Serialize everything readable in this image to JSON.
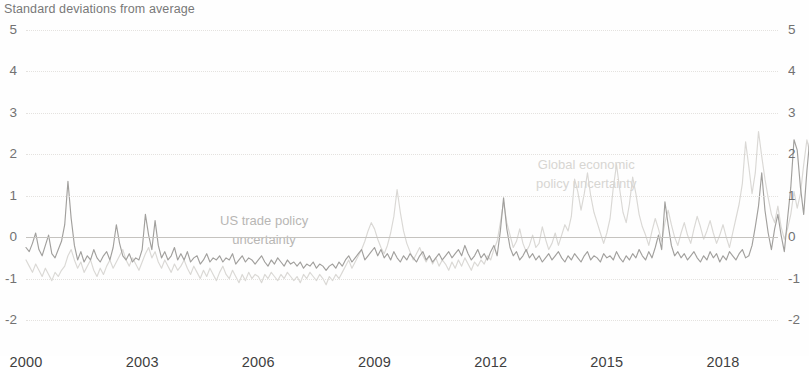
{
  "chart": {
    "axis_title": "Standard deviations from average",
    "y_ticks": [
      "5",
      "4",
      "3",
      "2",
      "1",
      "0",
      "-1",
      "-2"
    ],
    "x_ticks": [
      "2000",
      "2003",
      "2006",
      "2009",
      "2012",
      "2015",
      "2018"
    ],
    "annotations": {
      "us": "US trade policy\nuncertainty",
      "us_line1": "US trade policy",
      "us_line2": "uncertainty",
      "global_line1": "Global economic",
      "global_line2": "policy uncertainty"
    },
    "colors": {
      "us_trade_policy": "#8d8b88",
      "global_epu": "#d2d0cc",
      "zero_line": "#b9b6b1",
      "gridline": "#d9d7d2",
      "text": "#4a4a4a"
    }
  },
  "chart_data": {
    "type": "line",
    "title": "",
    "subtitle": "",
    "xlabel": "",
    "ylabel": "Standard deviations from average",
    "ylim": [
      -2,
      5
    ],
    "xlim": [
      2000.0,
      2019.42
    ],
    "grid": true,
    "legend": "annotations-inline",
    "y_tick_values": [
      5,
      4,
      3,
      2,
      1,
      0,
      -1,
      -2
    ],
    "x_tick_values": [
      2000,
      2003,
      2006,
      2009,
      2012,
      2015,
      2018
    ],
    "series": [
      {
        "name": "US trade policy uncertainty",
        "color": "#8d8b88",
        "x_start": 2000.0,
        "x_step": 0.0833333,
        "values": [
          -0.25,
          -0.35,
          -0.15,
          0.1,
          -0.3,
          -0.45,
          -0.2,
          0.05,
          -0.4,
          -0.5,
          -0.3,
          -0.1,
          0.3,
          1.35,
          0.45,
          -0.2,
          -0.55,
          -0.35,
          -0.6,
          -0.45,
          -0.55,
          -0.3,
          -0.5,
          -0.6,
          -0.45,
          -0.35,
          -0.55,
          -0.25,
          0.3,
          -0.15,
          -0.45,
          -0.55,
          -0.4,
          -0.6,
          -0.5,
          -0.55,
          -0.3,
          0.55,
          0.05,
          -0.3,
          0.4,
          -0.2,
          -0.5,
          -0.35,
          -0.55,
          -0.45,
          -0.25,
          -0.55,
          -0.4,
          -0.55,
          -0.35,
          -0.6,
          -0.5,
          -0.45,
          -0.65,
          -0.55,
          -0.4,
          -0.6,
          -0.5,
          -0.55,
          -0.45,
          -0.6,
          -0.5,
          -0.55,
          -0.4,
          -0.65,
          -0.55,
          -0.45,
          -0.6,
          -0.5,
          -0.55,
          -0.65,
          -0.55,
          -0.45,
          -0.6,
          -0.7,
          -0.55,
          -0.65,
          -0.5,
          -0.6,
          -0.7,
          -0.55,
          -0.65,
          -0.6,
          -0.7,
          -0.6,
          -0.75,
          -0.65,
          -0.7,
          -0.6,
          -0.75,
          -0.65,
          -0.7,
          -0.8,
          -0.7,
          -0.65,
          -0.75,
          -0.6,
          -0.7,
          -0.55,
          -0.45,
          -0.6,
          -0.5,
          -0.4,
          -0.3,
          -0.55,
          -0.45,
          -0.35,
          -0.25,
          -0.45,
          -0.3,
          -0.5,
          -0.4,
          -0.55,
          -0.35,
          -0.5,
          -0.6,
          -0.45,
          -0.55,
          -0.4,
          -0.5,
          -0.6,
          -0.45,
          -0.35,
          -0.55,
          -0.45,
          -0.6,
          -0.5,
          -0.4,
          -0.55,
          -0.45,
          -0.35,
          -0.5,
          -0.4,
          -0.3,
          -0.45,
          -0.2,
          -0.4,
          -0.55,
          -0.45,
          -0.3,
          -0.5,
          -0.4,
          -0.55,
          -0.35,
          -0.2,
          -0.45,
          0.15,
          0.95,
          0.2,
          -0.25,
          -0.45,
          -0.35,
          -0.55,
          -0.45,
          -0.3,
          -0.5,
          -0.4,
          -0.55,
          -0.45,
          -0.6,
          -0.5,
          -0.4,
          -0.55,
          -0.45,
          -0.35,
          -0.5,
          -0.6,
          -0.45,
          -0.55,
          -0.4,
          -0.5,
          -0.6,
          -0.45,
          -0.35,
          -0.55,
          -0.45,
          -0.5,
          -0.6,
          -0.4,
          -0.5,
          -0.45,
          -0.55,
          -0.35,
          -0.5,
          -0.6,
          -0.45,
          -0.55,
          -0.4,
          -0.5,
          -0.3,
          -0.45,
          -0.55,
          -0.35,
          -0.5,
          -0.25,
          0.05,
          -0.3,
          0.85,
          0.3,
          -0.2,
          -0.45,
          -0.35,
          -0.5,
          -0.4,
          -0.55,
          -0.45,
          -0.35,
          -0.5,
          -0.6,
          -0.45,
          -0.55,
          -0.35,
          -0.5,
          -0.4,
          -0.6,
          -0.45,
          -0.55,
          -0.35,
          -0.45,
          -0.55,
          -0.4,
          -0.3,
          -0.5,
          -0.45,
          -0.2,
          0.25,
          0.75,
          1.55,
          0.65,
          0.1,
          -0.3,
          0.2,
          0.55,
          0.05,
          -0.35,
          0.45,
          1.2,
          2.35,
          2.1,
          1.2,
          0.55,
          1.6,
          2.45,
          1.85,
          1.05,
          0.45,
          1.35,
          2.1,
          3.35,
          4.7,
          2.55,
          0.9
        ]
      },
      {
        "name": "Global economic policy uncertainty",
        "color": "#d2d0cc",
        "x_start": 2000.0,
        "x_step": 0.0833333,
        "values": [
          -0.55,
          -0.7,
          -0.85,
          -0.65,
          -0.8,
          -0.95,
          -0.75,
          -0.9,
          -1.05,
          -0.85,
          -0.95,
          -0.8,
          -0.7,
          -0.45,
          -0.3,
          -0.55,
          -0.75,
          -0.6,
          -0.85,
          -0.7,
          -0.55,
          -0.8,
          -0.95,
          -0.75,
          -0.9,
          -0.7,
          -0.55,
          -0.75,
          -0.6,
          -0.45,
          -0.3,
          -0.55,
          -0.7,
          -0.5,
          -0.65,
          -0.8,
          -0.6,
          -0.4,
          -0.25,
          -0.5,
          -0.35,
          -0.6,
          -0.75,
          -0.55,
          -0.7,
          -0.85,
          -0.65,
          -0.8,
          -0.7,
          -0.55,
          -0.75,
          -0.9,
          -0.7,
          -0.85,
          -1.0,
          -0.8,
          -0.95,
          -0.75,
          -0.9,
          -1.05,
          -0.85,
          -0.7,
          -0.9,
          -1.0,
          -0.8,
          -0.95,
          -1.1,
          -0.9,
          -1.05,
          -0.85,
          -1.0,
          -0.9,
          -0.95,
          -1.1,
          -0.9,
          -1.0,
          -0.85,
          -0.95,
          -1.05,
          -0.9,
          -1.0,
          -0.85,
          -0.95,
          -1.05,
          -0.95,
          -1.1,
          -0.9,
          -1.0,
          -0.85,
          -0.95,
          -1.05,
          -0.9,
          -1.0,
          -1.15,
          -0.95,
          -1.05,
          -0.9,
          -1.0,
          -0.85,
          -0.7,
          -0.55,
          -0.75,
          -0.6,
          -0.45,
          -0.3,
          -0.1,
          0.15,
          0.35,
          0.2,
          -0.05,
          -0.25,
          -0.4,
          -0.2,
          0.1,
          0.5,
          1.15,
          0.6,
          0.15,
          -0.15,
          -0.35,
          -0.55,
          -0.4,
          -0.25,
          -0.45,
          -0.6,
          -0.45,
          -0.65,
          -0.5,
          -0.7,
          -0.55,
          -0.65,
          -0.8,
          -0.6,
          -0.75,
          -0.55,
          -0.7,
          -0.5,
          -0.65,
          -0.8,
          -0.6,
          -0.7,
          -0.55,
          -0.65,
          -0.45,
          -0.55,
          -0.3,
          -0.1,
          0.35,
          0.85,
          0.35,
          0.05,
          -0.25,
          -0.1,
          0.2,
          -0.15,
          -0.35,
          -0.2,
          0.05,
          -0.25,
          -0.15,
          0.25,
          -0.05,
          -0.3,
          -0.15,
          0.1,
          -0.2,
          0.05,
          0.3,
          0.15,
          0.5,
          1.4,
          1.1,
          0.65,
          1.05,
          1.55,
          1.0,
          0.6,
          0.35,
          0.1,
          -0.15,
          0.1,
          0.45,
          1.2,
          1.75,
          1.15,
          0.6,
          0.35,
          0.8,
          1.45,
          1.05,
          0.55,
          0.25,
          0.05,
          -0.2,
          0.15,
          0.45,
          0.2,
          -0.1,
          0.35,
          0.65,
          0.3,
          0.0,
          -0.2,
          0.1,
          0.35,
          0.05,
          -0.15,
          0.2,
          0.5,
          0.25,
          -0.05,
          0.15,
          0.4,
          0.1,
          -0.15,
          0.05,
          0.3,
          0.0,
          -0.25,
          0.1,
          0.45,
          0.8,
          1.3,
          2.3,
          1.7,
          1.05,
          1.55,
          2.55,
          1.95,
          1.4,
          0.95,
          0.55,
          0.35,
          0.75,
          0.25,
          -0.05,
          0.2,
          0.55,
          1.1,
          0.7,
          1.05,
          1.75,
          2.35,
          2.0,
          1.45,
          2.8,
          3.55,
          2.6,
          1.85,
          2.4,
          3.2,
          2.45,
          1.55
        ]
      }
    ]
  }
}
